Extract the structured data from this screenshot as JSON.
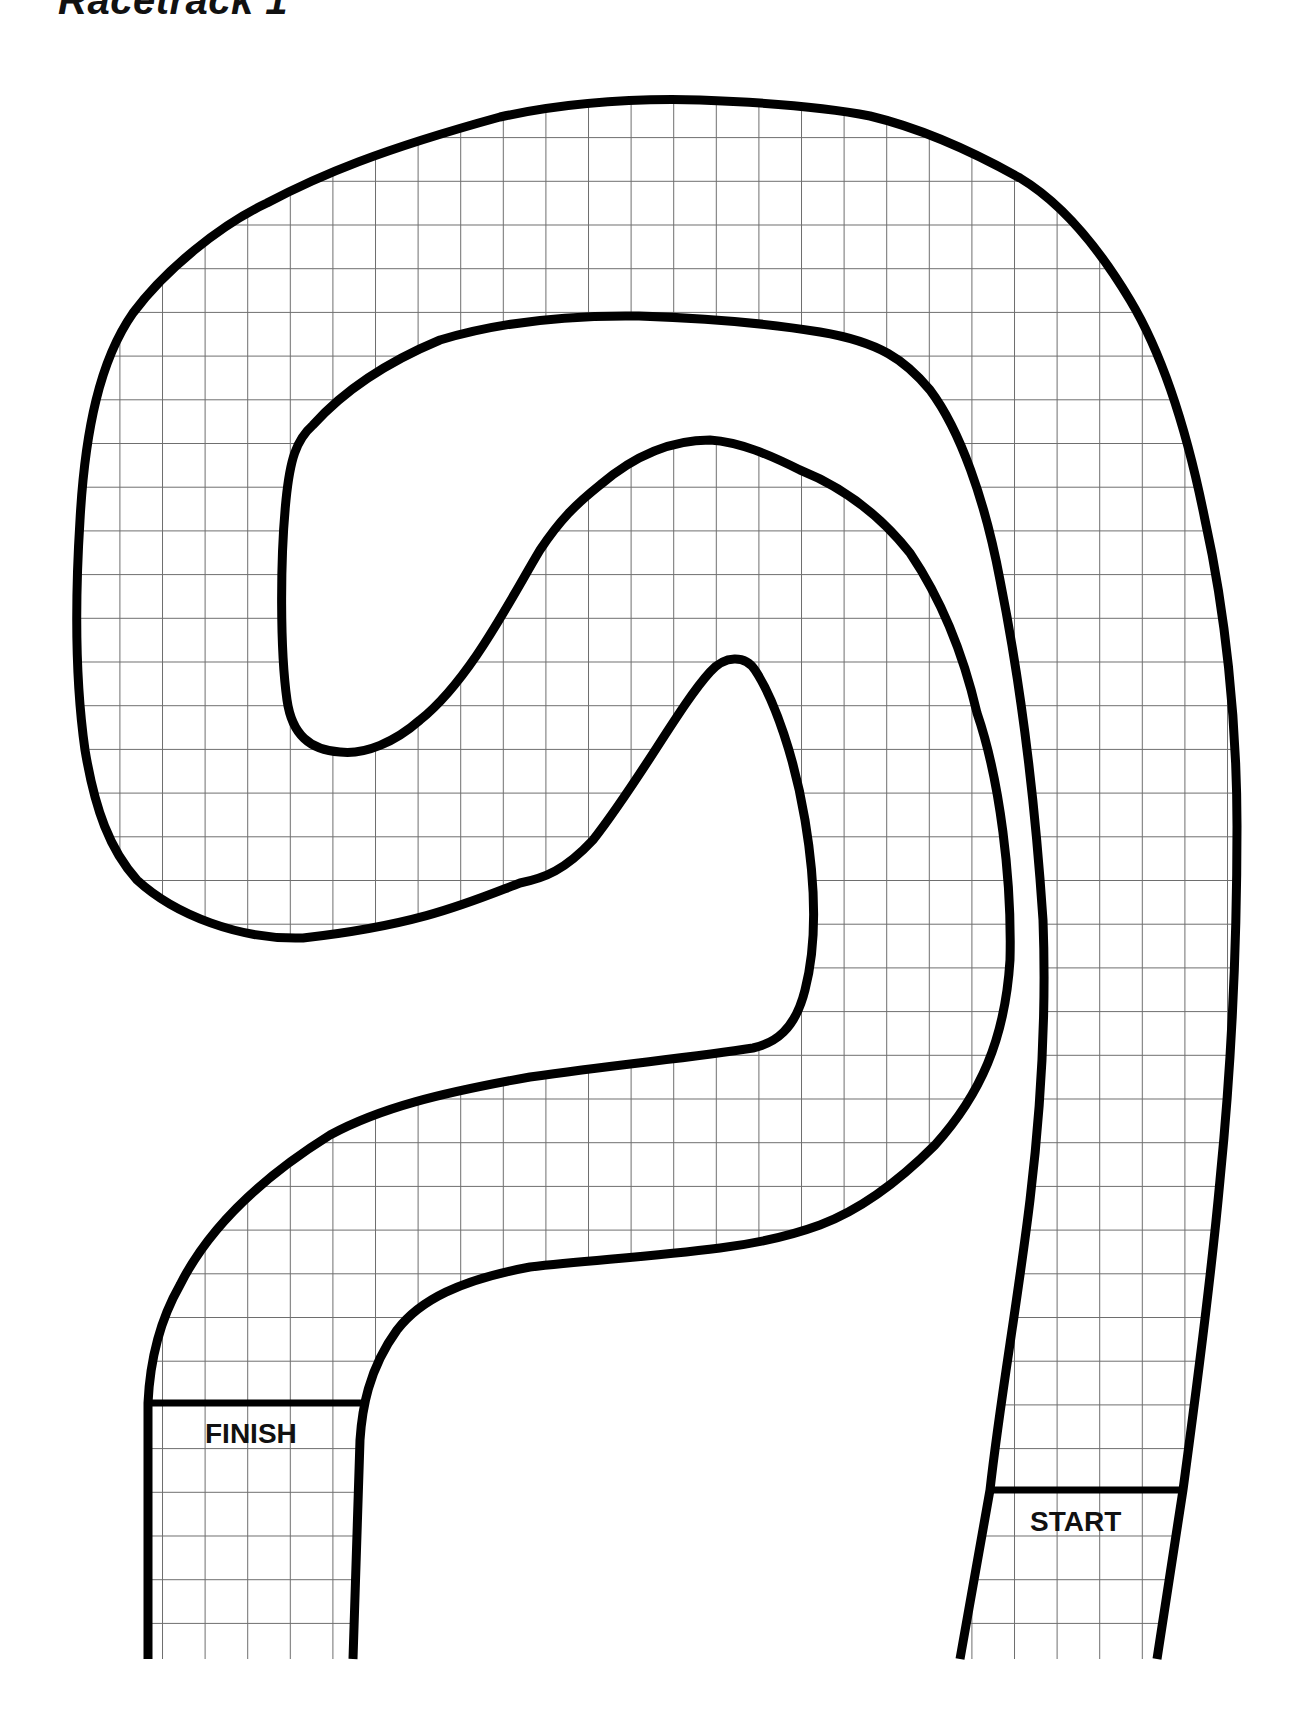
{
  "page": {
    "title": "Racetrack 1"
  },
  "track": {
    "finish_label": "FINISH",
    "start_label": "START",
    "grid": {
      "cell_width_px": 42.6,
      "cell_height_px": 43.7,
      "line_color": "#6e6e6e"
    },
    "colors": {
      "border": "#000000",
      "surface": "#ffffff"
    }
  }
}
